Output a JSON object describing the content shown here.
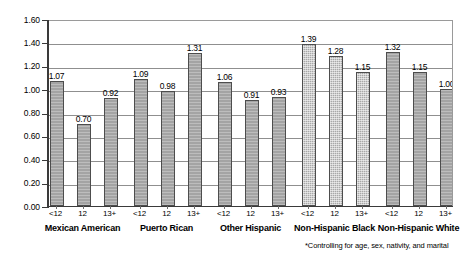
{
  "chart_data": {
    "type": "bar",
    "title": "",
    "subtitle": "",
    "xlabel": "",
    "ylabel": "",
    "ylim": [
      0.0,
      1.6
    ],
    "ytick_step": 0.2,
    "ytick_labels": [
      "0.00",
      "0.20",
      "0.40",
      "0.60",
      "0.80",
      "1.00",
      "1.20",
      "1.40",
      "1.60"
    ],
    "ytick_values": [
      0.0,
      0.2,
      0.4,
      0.6,
      0.8,
      1.0,
      1.2,
      1.4,
      1.6
    ],
    "grid": true,
    "legend": "none",
    "categories": [
      "<12",
      "12",
      "13+"
    ],
    "groups": [
      {
        "label": "Mexican American",
        "categories": [
          "<12",
          "12",
          "13+"
        ],
        "values": [
          1.07,
          0.7,
          0.92
        ],
        "value_labels": [
          "1.07",
          "0.70",
          "0.92"
        ]
      },
      {
        "label": "Puerto Rican",
        "categories": [
          "<12",
          "12",
          "13+"
        ],
        "values": [
          1.09,
          0.98,
          1.31
        ],
        "value_labels": [
          "1.09",
          "0.98",
          "1.31"
        ]
      },
      {
        "label": "Other Hispanic",
        "categories": [
          "<12",
          "12",
          "13+"
        ],
        "values": [
          1.06,
          0.91,
          0.93
        ],
        "value_labels": [
          "1.06",
          "0.91",
          "0.93"
        ]
      },
      {
        "label": "Non-Hispanic Black",
        "categories": [
          "<12",
          "12",
          "13+"
        ],
        "values": [
          1.39,
          1.28,
          1.15
        ],
        "value_labels": [
          "1.39",
          "1.28",
          "1.15"
        ]
      },
      {
        "label": "Non-Hispanic White",
        "categories": [
          "<12",
          "12",
          "13+"
        ],
        "values": [
          1.32,
          1.15,
          1.0
        ],
        "value_labels": [
          "1.32",
          "1.15",
          "1.00"
        ]
      }
    ],
    "all_values": [
      1.07,
      0.7,
      0.92,
      1.09,
      0.98,
      1.31,
      1.06,
      0.91,
      0.93,
      1.39,
      1.28,
      1.15,
      1.32,
      1.15,
      1.0
    ],
    "bar_color": "#a6a6a6",
    "bar_border_color": "#4d4d4d",
    "grid_color": "#8f8f8f",
    "axis_color": "#3a3a3a"
  },
  "footnote": "*Controlling for age, sex, nativity, and marital"
}
